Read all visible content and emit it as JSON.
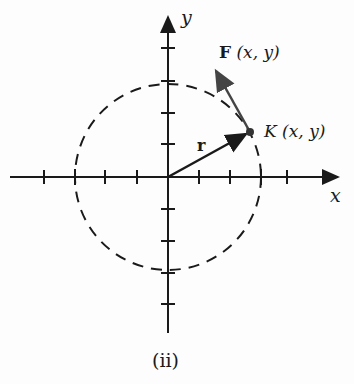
{
  "figure": {
    "caption": "(ii)",
    "axes": {
      "x_label": "x",
      "y_label": "y",
      "origin_px": [
        168,
        177
      ],
      "tick_spacing_px": 31,
      "x_ticks": [
        -4,
        -3,
        -2,
        -1,
        1,
        2,
        3,
        4
      ],
      "y_ticks": [
        4,
        3,
        2,
        1,
        -1,
        -2,
        -3,
        -4,
        -5
      ]
    },
    "circle": {
      "style": "dashed",
      "radius_units": 3
    },
    "vectors": {
      "r": {
        "label": "r",
        "from": "origin",
        "to": "K"
      },
      "F": {
        "label_bold": "F",
        "label_args": "(x, y)",
        "at": "K"
      }
    },
    "point": {
      "name": "K",
      "label_args": "(x, y)"
    },
    "colors": {
      "ink": "#1a1a1a",
      "arrow_gray": "#444444"
    }
  }
}
